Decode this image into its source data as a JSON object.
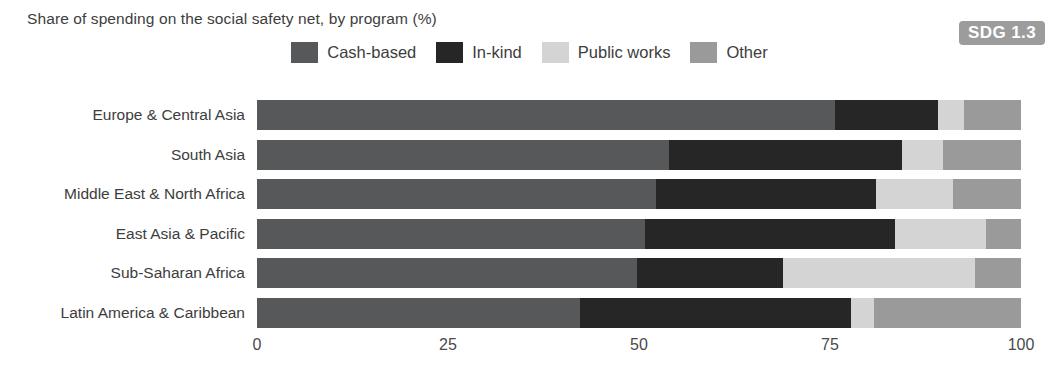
{
  "header": {
    "title_cut_off": "Share of spending on the social safety net, by program",
    "subtitle": "Share of spending on the social safety net, by program (%)",
    "sdg_badge": "SDG 1.3",
    "badge_color": "#9c9c9c"
  },
  "legend": {
    "items": [
      {
        "label": "Cash-based",
        "color": "#56585a"
      },
      {
        "label": "In-kind",
        "color": "#262627"
      },
      {
        "label": "Public works",
        "color": "#d4d4d4"
      },
      {
        "label": "Other",
        "color": "#9a9a9a"
      }
    ]
  },
  "chart_data": {
    "type": "bar",
    "orientation": "horizontal",
    "stacked": true,
    "title": "Share of spending on the social safety net, by program (%)",
    "xlabel": "",
    "ylabel": "",
    "xlim": [
      0,
      100
    ],
    "xticks": [
      "0",
      "25",
      "50",
      "75",
      "100"
    ],
    "xtick_values": [
      0,
      25,
      50,
      75,
      100
    ],
    "grid": false,
    "legend_position": "top-center",
    "categories": [
      "Europe & Central Asia",
      "South Asia",
      "Middle East & North Africa",
      "East Asia & Pacific",
      "Sub-Saharan Africa",
      "Latin America & Caribbean"
    ],
    "series": [
      {
        "name": "Cash-based",
        "color": "#56585a",
        "values": [
          75.7,
          54.0,
          52.2,
          50.8,
          49.7,
          42.3
        ]
      },
      {
        "name": "In-kind",
        "color": "#262627",
        "values": [
          13.5,
          30.5,
          28.8,
          32.7,
          19.1,
          35.5
        ]
      },
      {
        "name": "Public works",
        "color": "#d4d4d4",
        "values": [
          3.3,
          5.4,
          10.1,
          11.9,
          25.1,
          2.9
        ]
      },
      {
        "name": "Other",
        "color": "#9a9a9a",
        "values": [
          7.5,
          10.2,
          8.9,
          4.6,
          6.0,
          19.3
        ]
      }
    ]
  },
  "axis": {
    "ticks": [
      "0",
      "25",
      "50",
      "75",
      "100"
    ]
  }
}
